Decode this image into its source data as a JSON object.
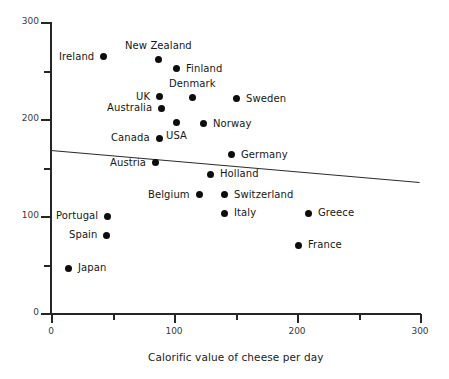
{
  "chart_data": {
    "type": "scatter",
    "title": "",
    "xlabel": "Calorific value of cheese per day",
    "ylabel": "",
    "xlim": [
      0,
      300
    ],
    "ylim": [
      0,
      300
    ],
    "grid": false,
    "legend": "none",
    "x_ticks": [
      {
        "value": 0,
        "label": "0",
        "major": true
      },
      {
        "value": 50,
        "label": "",
        "major": false
      },
      {
        "value": 100,
        "label": "100",
        "major": true
      },
      {
        "value": 150,
        "label": "",
        "major": false
      },
      {
        "value": 200,
        "label": "200",
        "major": true
      },
      {
        "value": 250,
        "label": "",
        "major": false
      },
      {
        "value": 300,
        "label": "300",
        "major": true
      }
    ],
    "y_ticks": [
      {
        "value": 0,
        "label": "0",
        "major": true
      },
      {
        "value": 50,
        "label": "",
        "major": false
      },
      {
        "value": 100,
        "label": "100",
        "major": true
      },
      {
        "value": 150,
        "label": "",
        "major": false
      },
      {
        "value": 200,
        "label": "200",
        "major": true
      },
      {
        "value": 250,
        "label": "",
        "major": false
      },
      {
        "value": 300,
        "label": "300",
        "major": true
      }
    ],
    "points": [
      {
        "label": "Ireland",
        "x": 43,
        "y": 264,
        "label_side": "left"
      },
      {
        "label": "New Zealand",
        "x": 87,
        "y": 261,
        "label_side": "above"
      },
      {
        "label": "Finland",
        "x": 102,
        "y": 252,
        "label_side": "right"
      },
      {
        "label": "UK",
        "x": 88,
        "y": 223,
        "label_side": "left"
      },
      {
        "label": "Denmark",
        "x": 115,
        "y": 222,
        "label_side": "above"
      },
      {
        "label": "Australia",
        "x": 90,
        "y": 211,
        "label_side": "left"
      },
      {
        "label": "Sweden",
        "x": 151,
        "y": 221,
        "label_side": "right"
      },
      {
        "label": "USA",
        "x": 102,
        "y": 196,
        "label_side": "below"
      },
      {
        "label": "Norway",
        "x": 124,
        "y": 195,
        "label_side": "right"
      },
      {
        "label": "Canada",
        "x": 88,
        "y": 180,
        "label_side": "left"
      },
      {
        "label": "Germany",
        "x": 147,
        "y": 163,
        "label_side": "right"
      },
      {
        "label": "Austria",
        "x": 85,
        "y": 155,
        "label_side": "left"
      },
      {
        "label": "Holland",
        "x": 130,
        "y": 143,
        "label_side": "right"
      },
      {
        "label": "Belgium",
        "x": 121,
        "y": 122,
        "label_side": "left"
      },
      {
        "label": "Switzerland",
        "x": 141,
        "y": 122,
        "label_side": "right"
      },
      {
        "label": "Italy",
        "x": 141,
        "y": 103,
        "label_side": "right"
      },
      {
        "label": "Greece",
        "x": 209,
        "y": 103,
        "label_side": "right"
      },
      {
        "label": "Portugal",
        "x": 46,
        "y": 100,
        "label_side": "left"
      },
      {
        "label": "Spain",
        "x": 45,
        "y": 80,
        "label_side": "left"
      },
      {
        "label": "France",
        "x": 201,
        "y": 70,
        "label_side": "right"
      },
      {
        "label": "Japan",
        "x": 14,
        "y": 46,
        "label_side": "right"
      }
    ],
    "trend_line": {
      "x_start": 0,
      "y_start": 168,
      "x_end": 300,
      "y_end": 135,
      "color": "#2b2b2b"
    }
  }
}
